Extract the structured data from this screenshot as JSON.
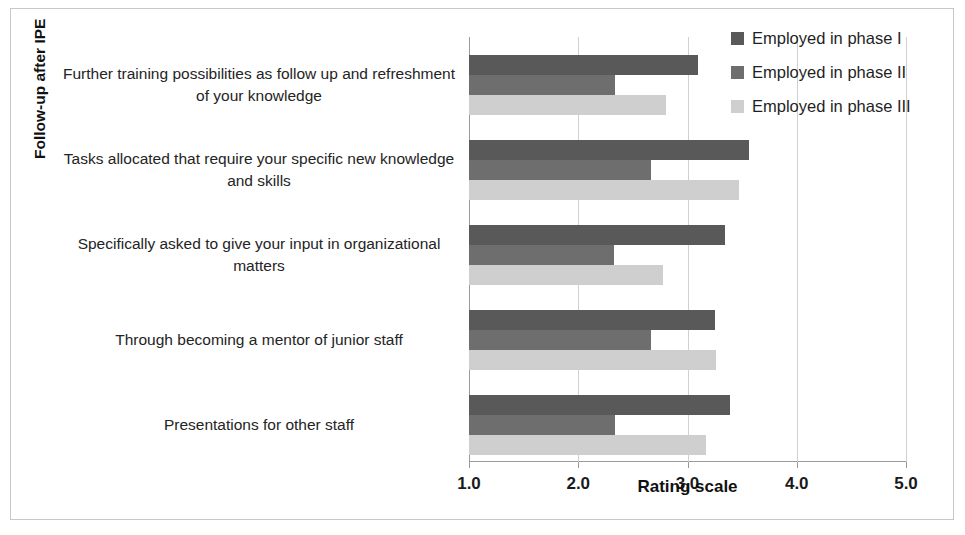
{
  "figure": {
    "top_clipped_caption": "",
    "background": "#ffffff",
    "frame_border": "#c8c8c8"
  },
  "legend": {
    "position": "top-right",
    "items": [
      {
        "label": "Employed in phase I",
        "color": "#595959",
        "swatch": "legend-swatch-phase-1"
      },
      {
        "label": "Employed in phase II",
        "color": "#6e6e6e",
        "swatch": "legend-swatch-phase-2"
      },
      {
        "label": "Employed in phase III",
        "color": "#cfcfcf",
        "swatch": "legend-swatch-phase-3"
      }
    ]
  },
  "axes": {
    "x_title": "Rating scale",
    "y_title": "Follow-up after IPE",
    "x_ticks": [
      "1.0",
      "2.0",
      "3.0",
      "4.0",
      "5.0"
    ]
  },
  "chart_data": {
    "type": "bar",
    "orientation": "horizontal",
    "title": "",
    "xlabel": "Rating scale",
    "ylabel": "Follow-up after IPE",
    "xlim": [
      1.0,
      5.0
    ],
    "xticks": [
      1.0,
      2.0,
      3.0,
      4.0,
      5.0
    ],
    "grid": true,
    "legend_position": "top-right",
    "categories": [
      "Further training possibilities as follow up and refreshment of your knowledge",
      "Tasks allocated that require your specific new knowledge and skills",
      "Specifically asked to give your input in organizational matters",
      "Through becoming a mentor of junior staff",
      "Presentations for other staff"
    ],
    "series": [
      {
        "name": "Employed in phase I",
        "color": "#595959",
        "values": [
          3.1,
          3.56,
          3.34,
          3.25,
          3.39
        ]
      },
      {
        "name": "Employed in phase II",
        "color": "#6e6e6e",
        "values": [
          2.34,
          2.67,
          2.33,
          2.67,
          2.34
        ]
      },
      {
        "name": "Employed in phase III",
        "color": "#cfcfcf",
        "values": [
          2.8,
          3.47,
          2.78,
          3.26,
          3.17
        ]
      }
    ]
  }
}
